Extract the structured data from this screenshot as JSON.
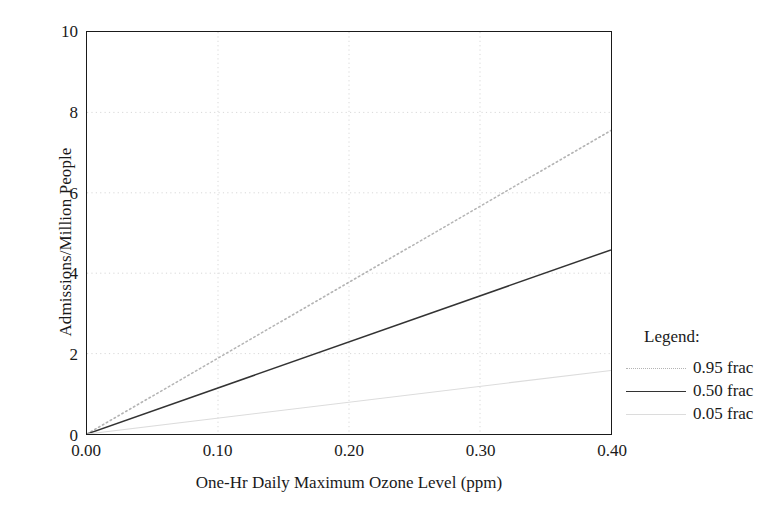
{
  "chart_data": {
    "type": "line",
    "title": "",
    "xlabel": "One-Hr Daily Maximum Ozone Level (ppm)",
    "ylabel": "Admissions/Million People",
    "xlim": [
      0.0,
      0.4
    ],
    "ylim": [
      0,
      10
    ],
    "xticks": [
      "0.00",
      "0.10",
      "0.20",
      "0.30",
      "0.40"
    ],
    "xtick_values": [
      0.0,
      0.1,
      0.2,
      0.3,
      0.4
    ],
    "yticks": [
      "0",
      "2",
      "4",
      "6",
      "8",
      "10"
    ],
    "ytick_values": [
      0,
      2,
      4,
      6,
      8,
      10
    ],
    "grid": true,
    "grid_style": "dotted",
    "grid_color": "#d8d8d8",
    "legend_position": "right",
    "x": [
      0.0,
      0.4
    ],
    "series": [
      {
        "name": "0.95 frac",
        "style": "dotted",
        "color": "#b4b4b4",
        "values": [
          0.0,
          7.55
        ]
      },
      {
        "name": "0.50 frac",
        "style": "solid",
        "color": "#333333",
        "values": [
          0.0,
          4.58
        ]
      },
      {
        "name": "0.05 frac",
        "style": "solid-faint",
        "color": "#dcdcdc",
        "values": [
          0.0,
          1.58
        ]
      }
    ]
  },
  "axes": {
    "y_title": "Admissions/Million People",
    "x_title": "One-Hr Daily Maximum Ozone Level (ppm)",
    "y_tick_labels": [
      "10",
      "8",
      "6",
      "4",
      "2",
      "0"
    ],
    "x_tick_labels": [
      "0.00",
      "0.10",
      "0.20",
      "0.30",
      "0.40"
    ]
  },
  "legend": {
    "title": "Legend:",
    "entries": [
      {
        "label": "0.95 frac"
      },
      {
        "label": "0.50 frac"
      },
      {
        "label": "0.05 frac"
      }
    ]
  },
  "colors": {
    "axis": "#1a1a1a",
    "grid": "#d8d8d8",
    "series_95": "#b4b4b4",
    "series_50": "#333333",
    "series_05": "#dcdcdc",
    "background": "#ffffff"
  }
}
